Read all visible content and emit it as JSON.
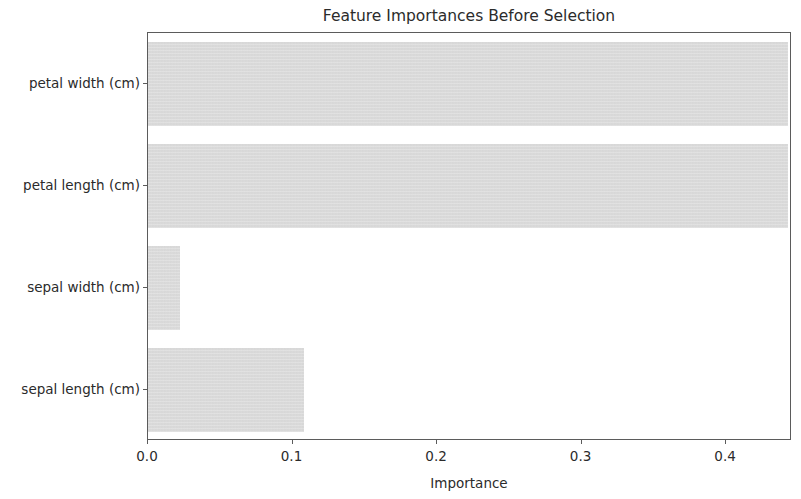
{
  "chart_data": {
    "type": "bar",
    "orientation": "horizontal",
    "title": "Feature Importances Before Selection",
    "xlabel": "Importance",
    "ylabel": "",
    "categories": [
      "sepal length (cm)",
      "sepal width (cm)",
      "petal length (cm)",
      "petal width (cm)"
    ],
    "values": [
      0.108,
      0.022,
      0.443,
      0.443
    ],
    "xlim": [
      0.0,
      0.4456
    ],
    "xticks": [
      0.0,
      0.1,
      0.2,
      0.3,
      0.4
    ],
    "xticklabels": [
      "0.0",
      "0.1",
      "0.2",
      "0.3",
      "0.4"
    ],
    "grid": false,
    "legend": null,
    "bar_color": "#d8d8d8",
    "axis_color": "#5b5b5b",
    "text_color": "#2b2b2b",
    "background": "#ffffff"
  }
}
